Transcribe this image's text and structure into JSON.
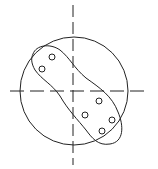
{
  "diagram": {
    "stroke_color": "#222222",
    "background": "#ffffff",
    "outer_circle": {
      "cx": 74,
      "cy": 91,
      "r": 54
    },
    "vertical_axis": {
      "x": 73,
      "y1": 5,
      "y2": 165
    },
    "horizontal_axis": {
      "y": 91,
      "x1": 10,
      "x2": 150
    },
    "points": [
      {
        "cx": 52,
        "cy": 57
      },
      {
        "cx": 42,
        "cy": 69
      },
      {
        "cx": 99,
        "cy": 101
      },
      {
        "cx": 85,
        "cy": 115
      },
      {
        "cx": 112,
        "cy": 120
      },
      {
        "cx": 102,
        "cy": 131
      }
    ]
  }
}
